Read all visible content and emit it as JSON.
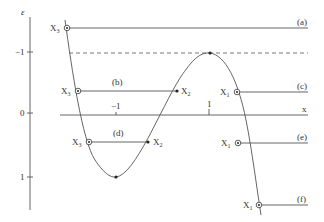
{
  "axes": {
    "energy_label": "ε",
    "x_label": "x",
    "energy_ticks": [
      {
        "label": "−1",
        "value": -1
      },
      {
        "label": "0",
        "value": 0
      },
      {
        "label": "1",
        "value": 1
      }
    ],
    "x_ticks": [
      {
        "label": "−1",
        "value": -1
      },
      {
        "label": "1",
        "value": 1
      }
    ]
  },
  "levels": [
    {
      "id": "a",
      "label": "(a)"
    },
    {
      "id": "b",
      "label": "(b)"
    },
    {
      "id": "c",
      "label": "(c)"
    },
    {
      "id": "d",
      "label": "(d)"
    },
    {
      "id": "e",
      "label": "(e)"
    },
    {
      "id": "f",
      "label": "(f)"
    }
  ],
  "points": {
    "x1": {
      "base": "X",
      "sub": "1"
    },
    "x2": {
      "base": "X",
      "sub": "2"
    },
    "x3": {
      "base": "X",
      "sub": "3"
    }
  },
  "colors": {
    "line": "#555555",
    "text": "#333333"
  }
}
